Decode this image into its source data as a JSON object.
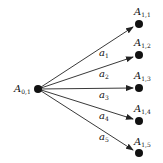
{
  "diagram": {
    "source": {
      "label": "A",
      "sub": "0,1",
      "x": 38,
      "y": 89
    },
    "targets": [
      {
        "label": "A",
        "sub": "1,1",
        "x": 139,
        "y": 24
      },
      {
        "label": "A",
        "sub": "1,2",
        "x": 139,
        "y": 55
      },
      {
        "label": "A",
        "sub": "1,3",
        "x": 139,
        "y": 88
      },
      {
        "label": "A",
        "sub": "1,4",
        "x": 139,
        "y": 121
      },
      {
        "label": "A",
        "sub": "1,5",
        "x": 139,
        "y": 153
      }
    ],
    "edges": [
      {
        "label": "a",
        "sub": "1"
      },
      {
        "label": "a",
        "sub": "2"
      },
      {
        "label": "a",
        "sub": "3"
      },
      {
        "label": "a",
        "sub": "4"
      },
      {
        "label": "a",
        "sub": "5"
      }
    ],
    "colors": {
      "line": "#222222",
      "node": "#111111",
      "background": "#ffffff"
    }
  }
}
